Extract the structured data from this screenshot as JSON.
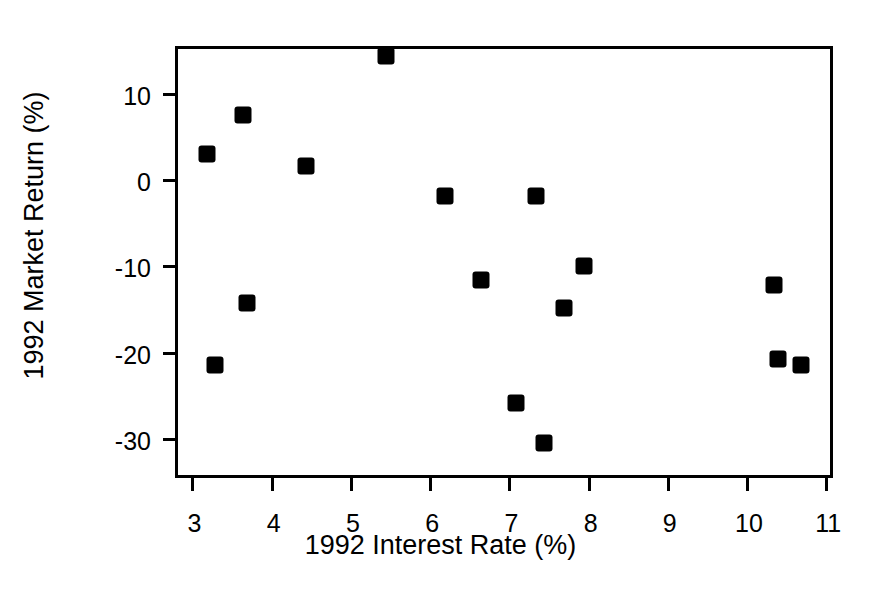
{
  "chart_data": {
    "type": "scatter",
    "title": "",
    "xlabel": "1992 Interest Rate (%)",
    "ylabel": "1992 Market Return (%)",
    "xlim": [
      2.83,
      11.06
    ],
    "ylim": [
      -34.3,
      15.1
    ],
    "xticks": [
      "3",
      "4",
      "5",
      "6",
      "7",
      "8",
      "9",
      "10",
      "11"
    ],
    "xtick_values": [
      3,
      4,
      5,
      6,
      7,
      8,
      9,
      10,
      11
    ],
    "yticks": [
      "10",
      "0",
      "-10",
      "-20",
      "-30"
    ],
    "ytick_values": [
      10,
      0,
      -10,
      -20,
      -30
    ],
    "grid": false,
    "legend": false,
    "marker": "filled-square",
    "marker_color": "#000000",
    "frame_color": "#000000",
    "background": "#ffffff",
    "n_points": 16,
    "x": [
      3.2,
      3.3,
      3.65,
      3.7,
      4.45,
      5.45,
      6.2,
      6.65,
      7.1,
      7.35,
      7.45,
      7.7,
      7.95,
      10.35,
      10.4,
      10.7
    ],
    "y": [
      2.9,
      -21.5,
      7.4,
      -14.4,
      1.5,
      14.3,
      -2.0,
      -11.7,
      -26.0,
      -2.0,
      -30.6,
      -14.9,
      -10.1,
      -12.3,
      -20.8,
      -21.5
    ],
    "points": [
      {
        "x": 3.2,
        "y": 2.9
      },
      {
        "x": 3.3,
        "y": -21.5
      },
      {
        "x": 3.65,
        "y": 7.4
      },
      {
        "x": 3.7,
        "y": -14.4
      },
      {
        "x": 4.45,
        "y": 1.5
      },
      {
        "x": 5.45,
        "y": 14.3
      },
      {
        "x": 6.2,
        "y": -2.0
      },
      {
        "x": 6.65,
        "y": -11.7
      },
      {
        "x": 7.1,
        "y": -26.0
      },
      {
        "x": 7.35,
        "y": -2.0
      },
      {
        "x": 7.45,
        "y": -30.6
      },
      {
        "x": 7.7,
        "y": -14.9
      },
      {
        "x": 7.95,
        "y": -10.1
      },
      {
        "x": 10.35,
        "y": -12.3
      },
      {
        "x": 10.4,
        "y": -20.8
      },
      {
        "x": 10.7,
        "y": -21.5
      }
    ]
  }
}
